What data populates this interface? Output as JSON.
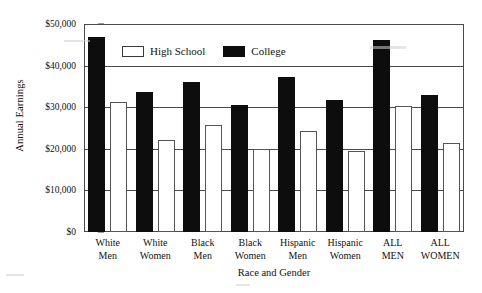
{
  "chart_data": {
    "type": "bar",
    "title": "",
    "xlabel": "Race and Gender",
    "ylabel": "Annual Earnings",
    "ylim": [
      0,
      50000
    ],
    "grid": true,
    "legend_position": "top-center",
    "categories": [
      "White Men",
      "White Women",
      "Black Men",
      "Black Women",
      "Hispanic Men",
      "Hispanic Women",
      "ALL MEN",
      "ALL WOMEN"
    ],
    "category_lines": [
      [
        "White",
        "Men"
      ],
      [
        "White",
        "Women"
      ],
      [
        "Black",
        "Men"
      ],
      [
        "Black",
        "Women"
      ],
      [
        "Hispanic",
        "Men"
      ],
      [
        "Hispanic",
        "Women"
      ],
      [
        "ALL",
        "MEN"
      ],
      [
        "ALL",
        "WOMEN"
      ]
    ],
    "series": [
      {
        "name": "High School",
        "color": "#ffffff",
        "values": [
          31200,
          22000,
          25700,
          20000,
          24300,
          19400,
          30200,
          21300
        ]
      },
      {
        "name": "College",
        "color": "#0d0d0d",
        "values": [
          46900,
          33600,
          36000,
          30500,
          37200,
          31800,
          46200,
          33000
        ]
      }
    ],
    "y_ticks": [
      {
        "value": 0,
        "label": "$0"
      },
      {
        "value": 10000,
        "label": "$10,000"
      },
      {
        "value": 20000,
        "label": "$20,000"
      },
      {
        "value": 30000,
        "label": "$30,000"
      },
      {
        "value": 40000,
        "label": "$40,000"
      },
      {
        "value": 50000,
        "label": "$50,000"
      }
    ]
  },
  "legend": {
    "items": [
      {
        "label": "High School",
        "swatch": "hs"
      },
      {
        "label": "College",
        "swatch": "col"
      }
    ]
  },
  "axes": {
    "y_title": "Annual Earnings",
    "x_title": "Race and Gender"
  }
}
